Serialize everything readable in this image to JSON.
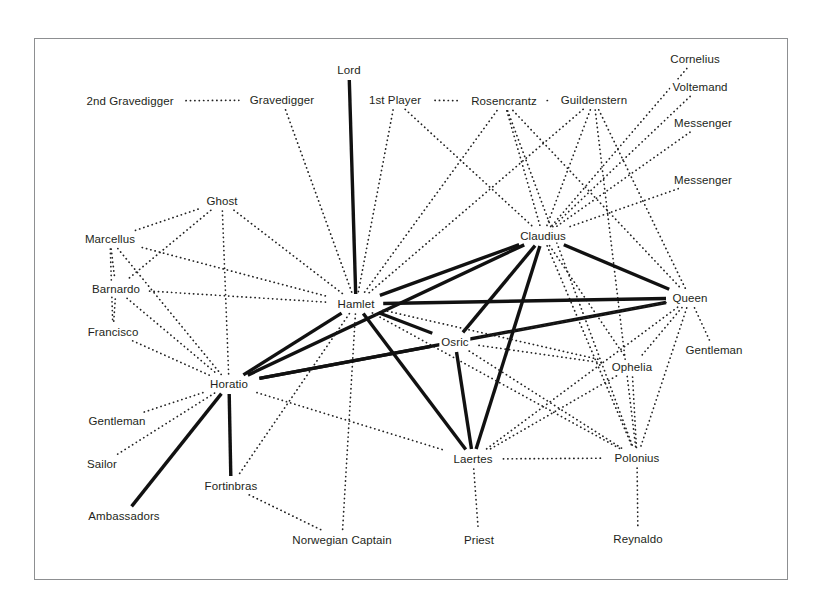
{
  "figure": {
    "kind": "character-network-diagram",
    "play": "Hamlet",
    "border_color": "#8d8f91",
    "background": "#ffffff",
    "strong_edge_color": "#111111",
    "weak_edge_color": "#222222"
  },
  "chart_data": {
    "type": "diagram",
    "title": "",
    "xlabel": "",
    "ylabel": "",
    "grid": false,
    "legend": null,
    "node_count": 31,
    "edge_count": 84,
    "nodes": [
      {
        "id": "2nd Gravedigger",
        "label": "2nd Gravedigger",
        "x": 130,
        "y": 101
      },
      {
        "id": "Gravedigger",
        "label": "Gravedigger",
        "x": 282,
        "y": 100
      },
      {
        "id": "Lord",
        "label": "Lord",
        "x": 349,
        "y": 70
      },
      {
        "id": "1st Player",
        "label": "1st Player",
        "x": 395,
        "y": 100
      },
      {
        "id": "Rosencrantz",
        "label": "Rosencrantz",
        "x": 504,
        "y": 101
      },
      {
        "id": "Guildenstern",
        "label": "Guildenstern",
        "x": 594,
        "y": 100
      },
      {
        "id": "Cornelius",
        "label": "Cornelius",
        "x": 695,
        "y": 59
      },
      {
        "id": "Voltemand",
        "label": "Voltemand",
        "x": 700,
        "y": 87
      },
      {
        "id": "Messenger1",
        "label": "Messenger",
        "x": 703,
        "y": 123
      },
      {
        "id": "Messenger2",
        "label": "Messenger",
        "x": 703,
        "y": 180
      },
      {
        "id": "Ghost",
        "label": "Ghost",
        "x": 222,
        "y": 201
      },
      {
        "id": "Marcellus",
        "label": "Marcellus",
        "x": 110,
        "y": 239
      },
      {
        "id": "Barnardo",
        "label": "Barnardo",
        "x": 116,
        "y": 289
      },
      {
        "id": "Francisco",
        "label": "Francisco",
        "x": 113,
        "y": 332
      },
      {
        "id": "Claudius",
        "label": "Claudius",
        "x": 543,
        "y": 236
      },
      {
        "id": "Hamlet",
        "label": "Hamlet",
        "x": 356,
        "y": 304
      },
      {
        "id": "Queen",
        "label": "Queen",
        "x": 690,
        "y": 298
      },
      {
        "id": "Osric",
        "label": "Osric",
        "x": 455,
        "y": 342
      },
      {
        "id": "Gentleman_R",
        "label": "Gentleman",
        "x": 714,
        "y": 350
      },
      {
        "id": "Ophelia",
        "label": "Ophelia",
        "x": 632,
        "y": 367
      },
      {
        "id": "Horatio",
        "label": "Horatio",
        "x": 229,
        "y": 384
      },
      {
        "id": "Gentleman_L",
        "label": "Gentleman",
        "x": 117,
        "y": 421
      },
      {
        "id": "Sailor",
        "label": "Sailor",
        "x": 102,
        "y": 464
      },
      {
        "id": "Laertes",
        "label": "Laertes",
        "x": 473,
        "y": 459
      },
      {
        "id": "Polonius",
        "label": "Polonius",
        "x": 637,
        "y": 458
      },
      {
        "id": "Fortinbras",
        "label": "Fortinbras",
        "x": 231,
        "y": 486
      },
      {
        "id": "Ambassadors",
        "label": "Ambassadors",
        "x": 124,
        "y": 516
      },
      {
        "id": "Norwegian Captain",
        "label": "Norwegian Captain",
        "x": 342,
        "y": 540
      },
      {
        "id": "Priest",
        "label": "Priest",
        "x": 479,
        "y": 540
      },
      {
        "id": "Reynaldo",
        "label": "Reynaldo",
        "x": 638,
        "y": 539
      }
    ],
    "edges": [
      {
        "source": "2nd Gravedigger",
        "target": "Gravedigger",
        "weight": "weak"
      },
      {
        "source": "Gravedigger",
        "target": "Hamlet",
        "weight": "weak"
      },
      {
        "source": "Lord",
        "target": "Hamlet",
        "weight": "strong"
      },
      {
        "source": "1st Player",
        "target": "Rosencrantz",
        "weight": "weak"
      },
      {
        "source": "1st Player",
        "target": "Hamlet",
        "weight": "weak"
      },
      {
        "source": "1st Player",
        "target": "Claudius",
        "weight": "weak"
      },
      {
        "source": "Rosencrantz",
        "target": "Hamlet",
        "weight": "weak"
      },
      {
        "source": "Rosencrantz",
        "target": "Claudius",
        "weight": "weak"
      },
      {
        "source": "Rosencrantz",
        "target": "Guildenstern",
        "weight": "weak"
      },
      {
        "source": "Rosencrantz",
        "target": "Queen",
        "weight": "weak"
      },
      {
        "source": "Rosencrantz",
        "target": "Polonius",
        "weight": "weak"
      },
      {
        "source": "Guildenstern",
        "target": "Hamlet",
        "weight": "weak"
      },
      {
        "source": "Guildenstern",
        "target": "Claudius",
        "weight": "weak"
      },
      {
        "source": "Guildenstern",
        "target": "Queen",
        "weight": "weak"
      },
      {
        "source": "Guildenstern",
        "target": "Polonius",
        "weight": "weak"
      },
      {
        "source": "Cornelius",
        "target": "Claudius",
        "weight": "weak"
      },
      {
        "source": "Voltemand",
        "target": "Claudius",
        "weight": "weak"
      },
      {
        "source": "Messenger1",
        "target": "Claudius",
        "weight": "weak"
      },
      {
        "source": "Messenger2",
        "target": "Claudius",
        "weight": "weak"
      },
      {
        "source": "Ghost",
        "target": "Hamlet",
        "weight": "weak"
      },
      {
        "source": "Ghost",
        "target": "Horatio",
        "weight": "weak"
      },
      {
        "source": "Ghost",
        "target": "Marcellus",
        "weight": "weak"
      },
      {
        "source": "Ghost",
        "target": "Barnardo",
        "weight": "weak"
      },
      {
        "source": "Marcellus",
        "target": "Hamlet",
        "weight": "weak"
      },
      {
        "source": "Marcellus",
        "target": "Horatio",
        "weight": "weak"
      },
      {
        "source": "Marcellus",
        "target": "Barnardo",
        "weight": "weak"
      },
      {
        "source": "Marcellus",
        "target": "Francisco",
        "weight": "weak"
      },
      {
        "source": "Barnardo",
        "target": "Hamlet",
        "weight": "weak"
      },
      {
        "source": "Barnardo",
        "target": "Horatio",
        "weight": "weak"
      },
      {
        "source": "Barnardo",
        "target": "Francisco",
        "weight": "weak"
      },
      {
        "source": "Francisco",
        "target": "Horatio",
        "weight": "weak"
      },
      {
        "source": "Claudius",
        "target": "Hamlet",
        "weight": "strong"
      },
      {
        "source": "Claudius",
        "target": "Queen",
        "weight": "strong"
      },
      {
        "source": "Claudius",
        "target": "Laertes",
        "weight": "strong"
      },
      {
        "source": "Claudius",
        "target": "Osric",
        "weight": "strong"
      },
      {
        "source": "Claudius",
        "target": "Horatio",
        "weight": "strong"
      },
      {
        "source": "Claudius",
        "target": "Polonius",
        "weight": "weak"
      },
      {
        "source": "Claudius",
        "target": "Ophelia",
        "weight": "weak"
      },
      {
        "source": "Hamlet",
        "target": "Queen",
        "weight": "strong"
      },
      {
        "source": "Hamlet",
        "target": "Horatio",
        "weight": "strong"
      },
      {
        "source": "Hamlet",
        "target": "Osric",
        "weight": "strong"
      },
      {
        "source": "Hamlet",
        "target": "Laertes",
        "weight": "strong"
      },
      {
        "source": "Hamlet",
        "target": "Polonius",
        "weight": "weak"
      },
      {
        "source": "Hamlet",
        "target": "Ophelia",
        "weight": "weak"
      },
      {
        "source": "Hamlet",
        "target": "Norwegian Captain",
        "weight": "weak"
      },
      {
        "source": "Hamlet",
        "target": "Fortinbras",
        "weight": "weak"
      },
      {
        "source": "Queen",
        "target": "Horatio",
        "weight": "strong"
      },
      {
        "source": "Queen",
        "target": "Ophelia",
        "weight": "weak"
      },
      {
        "source": "Queen",
        "target": "Polonius",
        "weight": "weak"
      },
      {
        "source": "Queen",
        "target": "Laertes",
        "weight": "weak"
      },
      {
        "source": "Queen",
        "target": "Gentleman_R",
        "weight": "weak"
      },
      {
        "source": "Queen",
        "target": "Osric",
        "weight": "weak"
      },
      {
        "source": "Osric",
        "target": "Laertes",
        "weight": "strong"
      },
      {
        "source": "Osric",
        "target": "Horatio",
        "weight": "strong"
      },
      {
        "source": "Osric",
        "target": "Ophelia",
        "weight": "weak"
      },
      {
        "source": "Osric",
        "target": "Polonius",
        "weight": "weak"
      },
      {
        "source": "Ophelia",
        "target": "Polonius",
        "weight": "weak"
      },
      {
        "source": "Ophelia",
        "target": "Laertes",
        "weight": "weak"
      },
      {
        "source": "Horatio",
        "target": "Laertes",
        "weight": "weak"
      },
      {
        "source": "Horatio",
        "target": "Gentleman_L",
        "weight": "weak"
      },
      {
        "source": "Horatio",
        "target": "Sailor",
        "weight": "weak"
      },
      {
        "source": "Horatio",
        "target": "Fortinbras",
        "weight": "strong"
      },
      {
        "source": "Horatio",
        "target": "Ambassadors",
        "weight": "strong"
      },
      {
        "source": "Laertes",
        "target": "Polonius",
        "weight": "weak"
      },
      {
        "source": "Laertes",
        "target": "Priest",
        "weight": "weak"
      },
      {
        "source": "Polonius",
        "target": "Reynaldo",
        "weight": "weak"
      },
      {
        "source": "Fortinbras",
        "target": "Norwegian Captain",
        "weight": "weak"
      }
    ]
  }
}
